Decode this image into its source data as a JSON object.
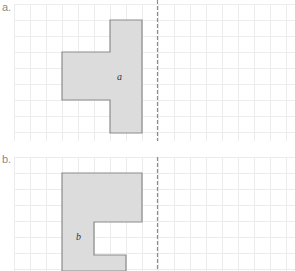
{
  "diagram": {
    "grid": {
      "cell_size": 16,
      "line_color": "#ececec"
    },
    "mirror_line": {
      "x": 157,
      "style": "dashed",
      "color": "#8c8c8c"
    },
    "shape_style": {
      "fill": "#dcdcdc",
      "stroke": "#8c8c8c"
    },
    "panels": [
      {
        "label": "a.",
        "shape_label": "a",
        "grid_top": 0,
        "grid_bottom": 141,
        "points": "110,20 142,20 142,133 110,133 110,100 62,100 62,52 110,52",
        "label_pos": {
          "x": 117,
          "y": 80
        }
      },
      {
        "label": "b.",
        "shape_label": "b",
        "grid_top": 157,
        "grid_bottom": 271,
        "points": "62,173 142,173 142,222 94,222 94,255 126,255 126,271 62,271",
        "label_pos": {
          "x": 76,
          "y": 240
        }
      }
    ]
  }
}
